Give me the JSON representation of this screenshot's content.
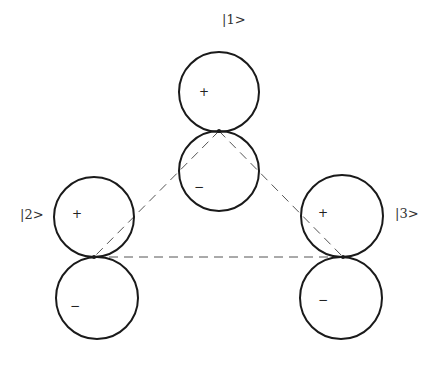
{
  "diagram": {
    "type": "orbital-triangle",
    "stroke_color": "#1a1a1a",
    "dash_color": "#555555",
    "states": [
      {
        "id": "1",
        "label": "|1>",
        "label_pos": [
          222,
          24
        ],
        "contact": [
          219,
          131
        ],
        "upper_lobe": {
          "center": [
            219,
            92
          ],
          "r": 40,
          "sign": "+",
          "sign_pos": [
            199,
            96
          ]
        },
        "lower_lobe": {
          "center": [
            219,
            171
          ],
          "r": 40,
          "sign": "−",
          "sign_pos": [
            194,
            191
          ]
        }
      },
      {
        "id": "2",
        "label": "|2>",
        "label_pos": [
          20,
          219
        ],
        "contact": [
          94,
          257
        ],
        "upper_lobe": {
          "center": [
            94,
            217
          ],
          "r": 40,
          "sign": "+",
          "sign_pos": [
            72,
            218
          ]
        },
        "lower_lobe": {
          "center": [
            97,
            298
          ],
          "r": 41,
          "sign": "−",
          "sign_pos": [
            70,
            310
          ]
        }
      },
      {
        "id": "3",
        "label": "|3>",
        "label_pos": [
          395,
          218
        ],
        "contact": [
          343,
          257
        ],
        "upper_lobe": {
          "center": [
            342,
            216
          ],
          "r": 41,
          "sign": "+",
          "sign_pos": [
            318,
            217
          ]
        },
        "lower_lobe": {
          "center": [
            341,
            298
          ],
          "r": 41,
          "sign": "−",
          "sign_pos": [
            318,
            304
          ]
        }
      }
    ],
    "connections": [
      {
        "from": "1",
        "to": "2",
        "style": "dashed"
      },
      {
        "from": "1",
        "to": "3",
        "style": "dashed"
      },
      {
        "from": "2",
        "to": "3",
        "style": "dashed"
      }
    ]
  }
}
